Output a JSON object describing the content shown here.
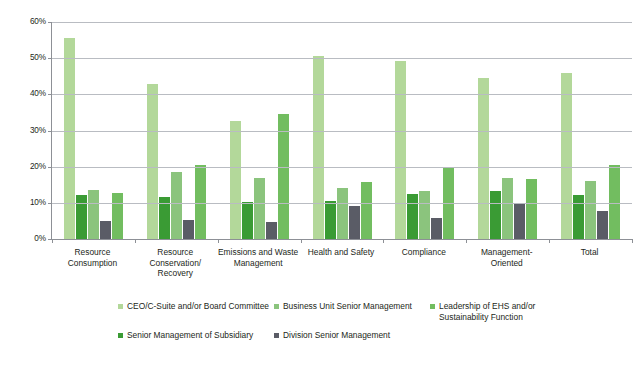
{
  "chart_data": {
    "type": "bar",
    "title": "",
    "subtitle": "",
    "xlabel": "",
    "ylabel": "",
    "ylim": [
      0,
      60
    ],
    "grid": true,
    "legend_position": "bottom",
    "y_ticks": [
      "0%",
      "10%",
      "20%",
      "30%",
      "40%",
      "50%",
      "60%"
    ],
    "y_tick_values": [
      0,
      10,
      20,
      30,
      40,
      50,
      60
    ],
    "categories": [
      "Resource Consumption",
      "Resource Conservation/ Recovery",
      "Emissions and Waste Management",
      "Health and Safety",
      "Compliance",
      "Management-Oriented",
      "Total"
    ],
    "series": [
      {
        "name": "CEO/C-Suite and/or Board Committee",
        "color": "#b3d89a",
        "values": [
          55.7,
          42.9,
          32.6,
          50.7,
          49.3,
          44.6,
          45.8
        ]
      },
      {
        "name": "Business Unit Senior Management",
        "color": "#3a9b34",
        "values": [
          12.3,
          11.5,
          10.2,
          10.5,
          12.5,
          13.2,
          12.2
        ]
      },
      {
        "name": "Leadership of EHS and/or Sustainability Function",
        "color": "#8bc47d",
        "values": [
          13.5,
          18.5,
          17.0,
          14.0,
          13.4,
          17.0,
          16.1
        ]
      },
      {
        "name": "Senior Management of Subsidiary",
        "color": "#5a5c66",
        "values": [
          5.0,
          5.3,
          4.8,
          9.2,
          5.8,
          9.6,
          7.7
        ]
      },
      {
        "name": "Division Senior Management",
        "color": "#72bd60",
        "values": [
          12.6,
          20.5,
          34.5,
          15.7,
          19.5,
          16.7,
          20.4
        ]
      }
    ],
    "legend": [
      {
        "label": "CEO/C-Suite and/or Board Committee",
        "color": "#b3d89a",
        "swatch": "legend-swatch-ceo"
      },
      {
        "label": "Business Unit Senior Management",
        "color": "#8bc47d",
        "swatch": "legend-swatch-business-unit"
      },
      {
        "label": "Leadership of EHS and/or Sustainability Function",
        "color": "#72bd60",
        "swatch": "legend-swatch-ehs"
      },
      {
        "label": "Senior Management of Subsidiary",
        "color": "#3a9b34",
        "swatch": "legend-swatch-subsidiary"
      },
      {
        "label": "Division Senior Management",
        "color": "#5a5c66",
        "swatch": "legend-swatch-division"
      }
    ]
  }
}
